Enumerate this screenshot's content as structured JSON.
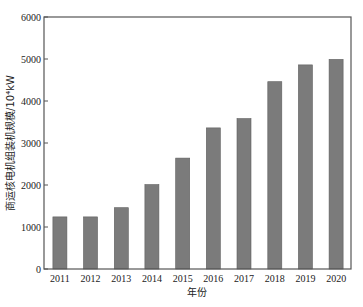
{
  "chart_data": {
    "type": "bar",
    "title": "",
    "xlabel": "年份",
    "ylabel": "商运核电机组装机规模/10⁴kW",
    "categories": [
      "2011",
      "2012",
      "2013",
      "2014",
      "2015",
      "2016",
      "2017",
      "2018",
      "2019",
      "2020"
    ],
    "values": [
      1240,
      1240,
      1460,
      2010,
      2640,
      3360,
      3580,
      4460,
      4860,
      4990
    ],
    "ylim": [
      0,
      6000
    ],
    "yticks": [
      0,
      1000,
      2000,
      3000,
      4000,
      5000,
      6000
    ],
    "grid": false,
    "legend": null,
    "bar_color": "#7b7b7b",
    "bar_edge_color": "#5e5e5e",
    "axis_color": "#555555"
  }
}
